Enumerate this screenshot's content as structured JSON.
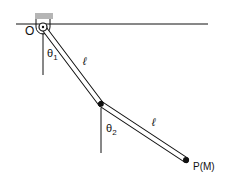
{
  "diagram": {
    "labels": {
      "pivot": "O",
      "angle1_base": "θ",
      "angle1_sub": "1",
      "angle2_base": "θ",
      "angle2_sub": "2",
      "length1": "ℓ",
      "length2": "ℓ",
      "mass": "P(M)"
    },
    "colors": {
      "line": "#111111",
      "support": "#b5b5b5",
      "rod_fill": "#ffffff"
    }
  }
}
